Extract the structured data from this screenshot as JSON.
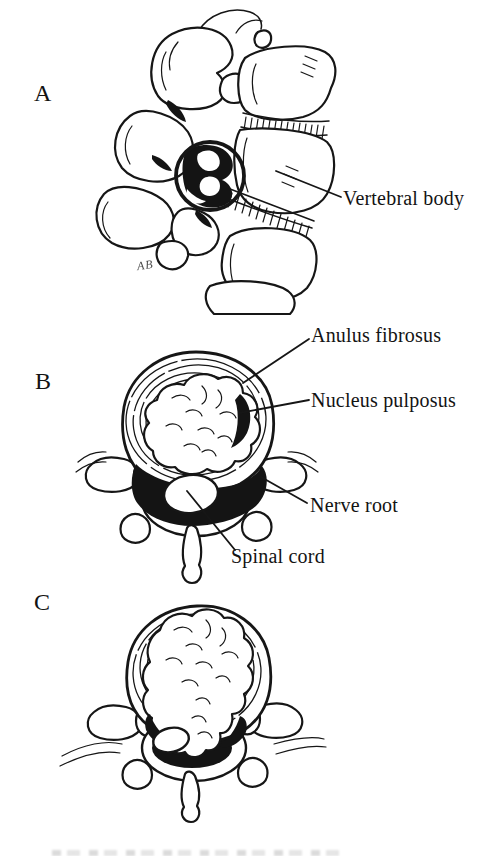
{
  "colors": {
    "paper": "#ffffff",
    "ink": "#161616"
  },
  "panels": {
    "a": {
      "letter": "A",
      "signature": "AB",
      "labels": {
        "vertebral_body": "Vertebral body"
      }
    },
    "b": {
      "letter": "B",
      "labels": {
        "anulus_fibrosus": "Anulus fibrosus",
        "nucleus_pulposus": "Nucleus pulposus",
        "nerve_root": "Nerve root",
        "spinal_cord": "Spinal cord"
      }
    },
    "c": {
      "letter": "C"
    }
  }
}
